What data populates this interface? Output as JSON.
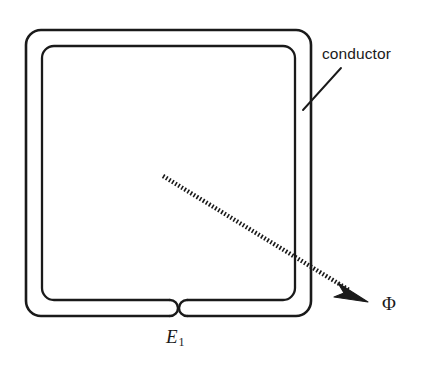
{
  "figure": {
    "background_color": "#ffffff",
    "stroke_color": "#1a1a1a",
    "labels": {
      "conductor": "conductor",
      "flux": "Φ",
      "emf": "E",
      "emf_subscript": "1"
    },
    "elements": {
      "conductor_outline_name": "conductor-tube-outline",
      "flux_arrow_name": "flux-arrow",
      "leader_line_name": "conductor-leader-line",
      "gap_name": "conductor-gap"
    },
    "geometry": {
      "outer_rect": {
        "x": 26,
        "y": 30,
        "width": 285,
        "height": 286,
        "radius": 15
      },
      "inner_rect": {
        "x": 42,
        "y": 46,
        "width": 253,
        "height": 254,
        "radius": 12
      },
      "gap_left_end_x": 170,
      "gap_right_end_x": 187,
      "flux_arrow_start": {
        "x": 163,
        "y": 176
      },
      "flux_arrow_end": {
        "x": 366,
        "y": 300
      },
      "leader_line_start": {
        "x": 303,
        "y": 110
      },
      "leader_line_end": {
        "x": 341,
        "y": 68
      }
    }
  }
}
